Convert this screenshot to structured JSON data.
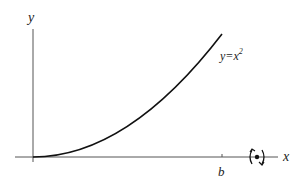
{
  "diagram": {
    "type": "function-plot-with-rotation",
    "axis_labels": {
      "x": "x",
      "y": "y"
    },
    "curve_label": {
      "base": "y=x",
      "exponent": "2"
    },
    "tick_labels": {
      "b": "b"
    },
    "rotation_symbol": "rotation-about-x-axis",
    "colors": {
      "axis": "#555555",
      "curve": "#111111",
      "text": "#222222"
    }
  }
}
